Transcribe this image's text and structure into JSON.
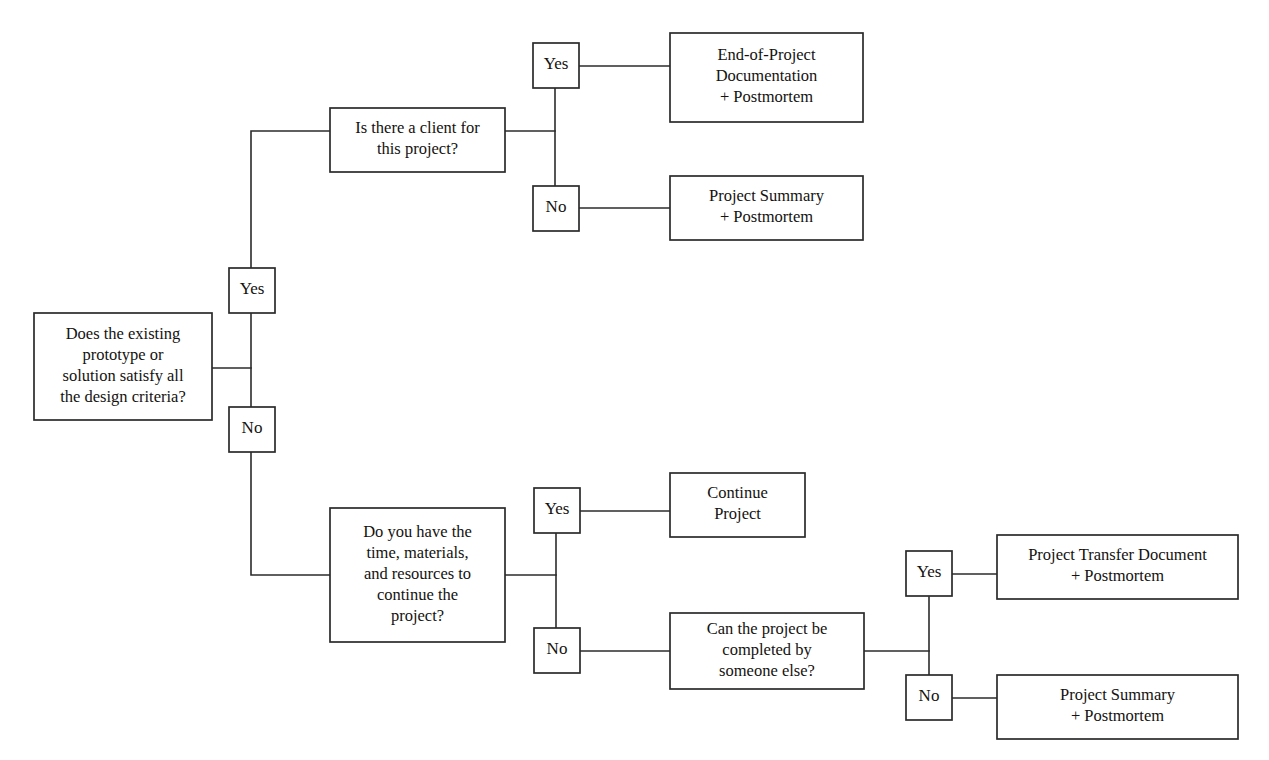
{
  "diagram": {
    "type": "flowchart",
    "background_color": "#ffffff",
    "line_color": "#2b2b2b",
    "text_color": "#14120f"
  },
  "nodes": {
    "root_question": {
      "name": "does-prototype-satisfy-criteria",
      "lines": [
        "Does the existing",
        "prototype or",
        "solution satisfy all",
        "the design criteria?"
      ],
      "x": 34,
      "y": 313,
      "w": 178,
      "h": 107
    },
    "client_question": {
      "name": "is-there-a-client",
      "lines": [
        "Is there a client for",
        "this project?"
      ],
      "x": 330,
      "y": 108,
      "w": 175,
      "h": 64
    },
    "end_of_project_doc": {
      "name": "end-of-project-documentation",
      "lines": [
        "End-of-Project",
        "Documentation",
        "+ Postmortem"
      ],
      "x": 670,
      "y": 33,
      "w": 193,
      "h": 89
    },
    "project_summary_top": {
      "name": "project-summary-postmortem-top",
      "lines": [
        "Project Summary",
        "+ Postmortem"
      ],
      "x": 670,
      "y": 176,
      "w": 193,
      "h": 64
    },
    "resources_question": {
      "name": "do-you-have-time-materials-resources",
      "lines": [
        "Do you have the",
        "time, materials,",
        "and resources to",
        "continue the",
        "project?"
      ],
      "x": 330,
      "y": 508,
      "w": 175,
      "h": 134
    },
    "continue_project": {
      "name": "continue-project",
      "lines": [
        "Continue",
        "Project"
      ],
      "x": 670,
      "y": 473,
      "w": 135,
      "h": 64
    },
    "someone_else_question": {
      "name": "can-project-be-completed-by-someone-else",
      "lines": [
        "Can the project be",
        "completed by",
        "someone else?"
      ],
      "x": 670,
      "y": 613,
      "w": 194,
      "h": 76
    },
    "transfer_document": {
      "name": "project-transfer-document",
      "lines": [
        "Project Transfer Document",
        "+ Postmortem"
      ],
      "x": 997,
      "y": 535,
      "w": 241,
      "h": 64
    },
    "project_summary_bottom": {
      "name": "project-summary-postmortem-bottom",
      "lines": [
        "Project Summary",
        "+ Postmortem"
      ],
      "x": 997,
      "y": 675,
      "w": 241,
      "h": 64
    }
  },
  "decision_labels": {
    "root_yes": {
      "name": "label-yes-root",
      "text": "Yes",
      "x": 229,
      "y": 268,
      "w": 46,
      "h": 45
    },
    "root_no": {
      "name": "label-no-root",
      "text": "No",
      "x": 229,
      "y": 407,
      "w": 46,
      "h": 45
    },
    "client_yes": {
      "name": "label-yes-client",
      "text": "Yes",
      "x": 533,
      "y": 43,
      "w": 46,
      "h": 45
    },
    "client_no": {
      "name": "label-no-client",
      "text": "No",
      "x": 533,
      "y": 186,
      "w": 46,
      "h": 45
    },
    "resources_yes": {
      "name": "label-yes-resources",
      "text": "Yes",
      "x": 534,
      "y": 488,
      "w": 46,
      "h": 45
    },
    "resources_no": {
      "name": "label-no-resources",
      "text": "No",
      "x": 534,
      "y": 628,
      "w": 46,
      "h": 45
    },
    "someone_else_yes": {
      "name": "label-yes-someone-else",
      "text": "Yes",
      "x": 906,
      "y": 551,
      "w": 46,
      "h": 45
    },
    "someone_else_no": {
      "name": "label-no-someone-else",
      "text": "No",
      "x": 906,
      "y": 675,
      "w": 46,
      "h": 45
    }
  },
  "connectors": [
    {
      "name": "connector-root-to-branch-trunk",
      "d": "M 212 368 L 251 368"
    },
    {
      "name": "connector-root-trunk-vertical",
      "d": "M 251 313 L 251 407"
    },
    {
      "name": "connector-root-yes-up",
      "d": "M 251 268 L 251 131 L 330 131"
    },
    {
      "name": "connector-root-no-down",
      "d": "M 251 452 L 251 575 L 330 575"
    },
    {
      "name": "connector-client-to-trunk",
      "d": "M 505 131 L 555 131"
    },
    {
      "name": "connector-client-trunk-vertical",
      "d": "M 555 88 L 555 186"
    },
    {
      "name": "connector-client-yes-to-doc",
      "d": "M 579 66 L 670 66"
    },
    {
      "name": "connector-client-no-to-summary",
      "d": "M 579 208 L 670 208"
    },
    {
      "name": "connector-resources-to-trunk",
      "d": "M 505 575 L 556 575"
    },
    {
      "name": "connector-resources-trunk-vertical",
      "d": "M 556 533 L 556 628"
    },
    {
      "name": "connector-resources-yes-to-continue",
      "d": "M 580 511 L 670 511"
    },
    {
      "name": "connector-resources-no-to-someone-else",
      "d": "M 580 651 L 670 651"
    },
    {
      "name": "connector-someone-else-to-trunk",
      "d": "M 864 651 L 929 651"
    },
    {
      "name": "connector-someone-else-trunk-vertical",
      "d": "M 929 597 L 929 675"
    },
    {
      "name": "connector-someone-else-yes-to-transfer",
      "d": "M 952 574 L 997 574"
    },
    {
      "name": "connector-someone-else-no-to-summary",
      "d": "M 952 698 L 997 698"
    }
  ]
}
